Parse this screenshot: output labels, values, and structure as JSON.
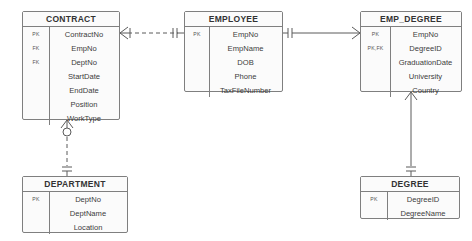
{
  "diagram": {
    "notation": "crows-foot",
    "background_color": "#ffffff",
    "entity_fill_color": "#fbfbfb",
    "entity_border_color": "#7f7f7f",
    "text_color": "#3b3b3b"
  },
  "entities": [
    {
      "name": "CONTRACT",
      "attributes": [
        {
          "key": "PK",
          "name": "ContractNo"
        },
        {
          "key": "FK",
          "name": "EmpNo"
        },
        {
          "key": "FK",
          "name": "DeptNo"
        },
        {
          "key": "",
          "name": "StartDate"
        },
        {
          "key": "",
          "name": "EndDate"
        },
        {
          "key": "",
          "name": "Position"
        },
        {
          "key": "",
          "name": "WorkType"
        }
      ]
    },
    {
      "name": "EMPLOYEE",
      "attributes": [
        {
          "key": "PK",
          "name": "EmpNo"
        },
        {
          "key": "",
          "name": "EmpName"
        },
        {
          "key": "",
          "name": "DOB"
        },
        {
          "key": "",
          "name": "Phone"
        },
        {
          "key": "",
          "name": "TaxFileNumber"
        }
      ]
    },
    {
      "name": "EMP_DEGREE",
      "attributes": [
        {
          "key": "PK",
          "name": "EmpNo"
        },
        {
          "key": "PK,FK",
          "name": "DegreeID"
        },
        {
          "key": "",
          "name": "GraduationDate"
        },
        {
          "key": "",
          "name": "University"
        },
        {
          "key": "",
          "name": "Country"
        }
      ]
    },
    {
      "name": "DEPARTMENT",
      "attributes": [
        {
          "key": "PK",
          "name": "DeptNo"
        },
        {
          "key": "",
          "name": "DeptName"
        },
        {
          "key": "",
          "name": "Location"
        }
      ]
    },
    {
      "name": "DEGREE",
      "attributes": [
        {
          "key": "PK",
          "name": "DegreeID"
        },
        {
          "key": "",
          "name": "DegreeName"
        }
      ]
    }
  ],
  "relationships": [
    {
      "id": "contract-employee",
      "from_entity": "CONTRACT",
      "to_entity": "EMPLOYEE",
      "line_style": "dashed",
      "from_cardinality": "one-or-many",
      "to_cardinality": "one-and-only-one"
    },
    {
      "id": "contract-department",
      "from_entity": "CONTRACT",
      "to_entity": "DEPARTMENT",
      "line_style": "dashed",
      "from_cardinality": "zero-or-many",
      "to_cardinality": "one-and-only-one"
    },
    {
      "id": "employee-empdegree",
      "from_entity": "EMPLOYEE",
      "to_entity": "EMP_DEGREE",
      "line_style": "solid",
      "from_cardinality": "one-and-only-one",
      "to_cardinality": "zero-or-many"
    },
    {
      "id": "empdegree-degree",
      "from_entity": "EMP_DEGREE",
      "to_entity": "DEGREE",
      "line_style": "solid",
      "from_cardinality": "zero-or-many",
      "to_cardinality": "one-and-only-one"
    }
  ]
}
